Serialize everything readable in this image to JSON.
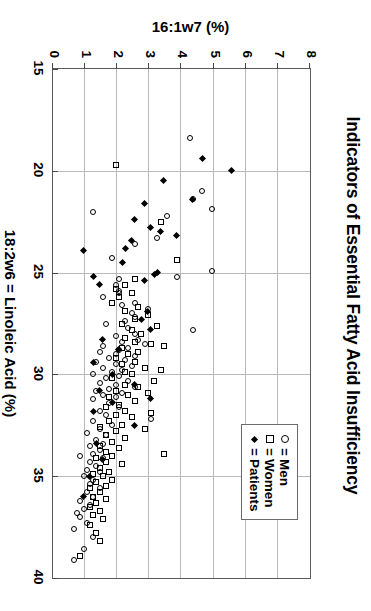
{
  "chart_data": {
    "type": "scatter",
    "title": "Indicators of Essential Fatty Acid Insufficiency",
    "xlabel": "18:2w6 = Linoleic Acid (%)",
    "ylabel": "16:1w7 (%)",
    "xlim": [
      15,
      40
    ],
    "ylim": [
      0,
      8
    ],
    "xticks": [
      15,
      20,
      25,
      30,
      35,
      40
    ],
    "yticks": [
      0,
      1,
      2,
      3,
      4,
      5,
      6,
      7,
      8
    ],
    "xtick_labels": [
      "15",
      "20",
      "25",
      "30",
      "35",
      "40"
    ],
    "ytick_labels": [
      "0",
      "1",
      "2",
      "3",
      "4",
      "5",
      "6",
      "7",
      "8"
    ],
    "grid": true,
    "rotation_deg": 90,
    "legend_position": "upper-right",
    "legend": [
      {
        "marker": "open-circle",
        "equals": "=",
        "label": "Men"
      },
      {
        "marker": "open-square",
        "equals": "=",
        "label": "Women"
      },
      {
        "marker": "filled-diamond",
        "equals": "=",
        "label": "Patients"
      }
    ],
    "series": [
      {
        "name": "Men",
        "marker": "open-circle",
        "color": "#000000",
        "points": [
          [
            18.4,
            4.25
          ],
          [
            21.0,
            4.65
          ],
          [
            21.4,
            4.35
          ],
          [
            21.9,
            4.95
          ],
          [
            22.2,
            3.55
          ],
          [
            22.0,
            1.25
          ],
          [
            23.3,
            3.25
          ],
          [
            23.6,
            2.55
          ],
          [
            24.3,
            1.85
          ],
          [
            24.9,
            4.95
          ],
          [
            25.2,
            3.85
          ],
          [
            25.3,
            2.05
          ],
          [
            25.6,
            1.95
          ],
          [
            25.9,
            2.05
          ],
          [
            26.0,
            2.05
          ],
          [
            26.2,
            1.55
          ],
          [
            26.5,
            2.55
          ],
          [
            26.8,
            2.95
          ],
          [
            26.6,
            2.15
          ],
          [
            27.0,
            2.45
          ],
          [
            27.2,
            2.55
          ],
          [
            27.4,
            2.25
          ],
          [
            27.5,
            1.65
          ],
          [
            27.7,
            2.35
          ],
          [
            27.8,
            4.35
          ],
          [
            28.0,
            2.55
          ],
          [
            28.1,
            1.95
          ],
          [
            28.3,
            2.65
          ],
          [
            28.4,
            2.15
          ],
          [
            28.5,
            2.85
          ],
          [
            28.6,
            1.55
          ],
          [
            28.7,
            2.35
          ],
          [
            28.8,
            2.05
          ],
          [
            28.9,
            1.45
          ],
          [
            29.0,
            1.95
          ],
          [
            29.1,
            2.55
          ],
          [
            29.2,
            1.75
          ],
          [
            29.3,
            2.25
          ],
          [
            29.4,
            1.35
          ],
          [
            29.5,
            1.95
          ],
          [
            29.6,
            2.45
          ],
          [
            29.7,
            1.55
          ],
          [
            29.8,
            2.15
          ],
          [
            29.9,
            1.85
          ],
          [
            30.0,
            1.25
          ],
          [
            30.1,
            2.05
          ],
          [
            30.2,
            1.65
          ],
          [
            30.3,
            2.35
          ],
          [
            30.4,
            1.45
          ],
          [
            30.5,
            1.95
          ],
          [
            30.6,
            2.55
          ],
          [
            30.7,
            1.75
          ],
          [
            30.8,
            1.35
          ],
          [
            30.9,
            2.15
          ],
          [
            31.0,
            1.55
          ],
          [
            31.1,
            1.95
          ],
          [
            31.2,
            1.25
          ],
          [
            31.4,
            1.75
          ],
          [
            31.6,
            2.05
          ],
          [
            31.8,
            1.45
          ],
          [
            32.0,
            1.65
          ],
          [
            32.2,
            3.05
          ],
          [
            32.3,
            1.25
          ],
          [
            32.5,
            1.85
          ],
          [
            32.7,
            1.45
          ],
          [
            32.9,
            1.05
          ],
          [
            33.0,
            1.65
          ],
          [
            33.2,
            1.35
          ],
          [
            33.4,
            1.55
          ],
          [
            33.5,
            1.15
          ],
          [
            33.7,
            1.45
          ],
          [
            33.9,
            1.25
          ],
          [
            34.0,
            0.85
          ],
          [
            34.1,
            1.55
          ],
          [
            34.3,
            1.15
          ],
          [
            34.5,
            1.35
          ],
          [
            34.7,
            1.05
          ],
          [
            34.8,
            1.45
          ],
          [
            35.0,
            0.95
          ],
          [
            35.2,
            1.25
          ],
          [
            35.4,
            1.15
          ],
          [
            35.6,
            1.45
          ],
          [
            35.8,
            1.05
          ],
          [
            36.0,
            1.25
          ],
          [
            36.2,
            0.85
          ],
          [
            36.4,
            1.15
          ],
          [
            36.6,
            0.95
          ],
          [
            36.8,
            0.75
          ],
          [
            37.0,
            0.85
          ],
          [
            37.3,
            1.05
          ],
          [
            37.6,
            0.65
          ],
          [
            38.0,
            1.25
          ],
          [
            38.6,
            0.95
          ],
          [
            39.1,
            0.65
          ]
        ]
      },
      {
        "name": "Women",
        "marker": "open-square",
        "color": "#000000",
        "points": [
          [
            19.7,
            1.95
          ],
          [
            22.5,
            3.35
          ],
          [
            24.4,
            3.85
          ],
          [
            25.3,
            2.55
          ],
          [
            25.6,
            2.25
          ],
          [
            25.8,
            1.95
          ],
          [
            26.0,
            2.45
          ],
          [
            26.2,
            2.05
          ],
          [
            26.5,
            1.85
          ],
          [
            26.7,
            2.65
          ],
          [
            26.9,
            2.25
          ],
          [
            27.1,
            2.95
          ],
          [
            27.3,
            2.55
          ],
          [
            27.5,
            2.15
          ],
          [
            27.6,
            3.25
          ],
          [
            27.8,
            2.45
          ],
          [
            28.0,
            2.75
          ],
          [
            28.2,
            2.25
          ],
          [
            28.4,
            2.55
          ],
          [
            28.5,
            3.05
          ],
          [
            28.7,
            2.15
          ],
          [
            28.9,
            2.65
          ],
          [
            29.0,
            2.35
          ],
          [
            29.2,
            1.95
          ],
          [
            29.4,
            2.55
          ],
          [
            29.5,
            2.15
          ],
          [
            29.7,
            2.85
          ],
          [
            29.9,
            2.25
          ],
          [
            30.0,
            2.45
          ],
          [
            30.2,
            1.85
          ],
          [
            30.3,
            3.15
          ],
          [
            30.5,
            2.25
          ],
          [
            30.6,
            2.65
          ],
          [
            30.8,
            1.95
          ],
          [
            31.0,
            2.35
          ],
          [
            31.1,
            1.75
          ],
          [
            31.3,
            2.55
          ],
          [
            31.5,
            2.05
          ],
          [
            31.6,
            1.65
          ],
          [
            31.8,
            2.25
          ],
          [
            32.0,
            1.95
          ],
          [
            32.1,
            2.45
          ],
          [
            32.3,
            1.75
          ],
          [
            32.5,
            2.15
          ],
          [
            32.6,
            1.45
          ],
          [
            32.8,
            1.95
          ],
          [
            33.0,
            1.65
          ],
          [
            33.1,
            2.25
          ],
          [
            33.3,
            1.85
          ],
          [
            33.5,
            1.45
          ],
          [
            33.6,
            2.05
          ],
          [
            33.8,
            1.65
          ],
          [
            34.0,
            1.85
          ],
          [
            34.1,
            1.35
          ],
          [
            34.3,
            1.65
          ],
          [
            34.4,
            2.15
          ],
          [
            34.6,
            1.45
          ],
          [
            34.8,
            1.75
          ],
          [
            34.9,
            1.25
          ],
          [
            35.0,
            1.55
          ],
          [
            35.2,
            1.85
          ],
          [
            35.3,
            1.35
          ],
          [
            35.5,
            1.65
          ],
          [
            35.6,
            1.15
          ],
          [
            35.8,
            1.45
          ],
          [
            36.0,
            1.25
          ],
          [
            36.1,
            1.65
          ],
          [
            36.3,
            1.35
          ],
          [
            36.5,
            1.15
          ],
          [
            36.7,
            1.45
          ],
          [
            36.9,
            1.25
          ],
          [
            37.1,
            1.55
          ],
          [
            37.4,
            1.15
          ],
          [
            37.8,
            1.35
          ],
          [
            38.2,
            1.45
          ],
          [
            38.9,
            0.85
          ],
          [
            33.9,
            3.45
          ],
          [
            32.7,
            2.85
          ],
          [
            31.9,
            3.05
          ],
          [
            30.9,
            2.95
          ],
          [
            29.8,
            3.35
          ],
          [
            28.6,
            3.45
          ]
        ]
      },
      {
        "name": "Patients",
        "marker": "filled-diamond",
        "color": "#000000",
        "points": [
          [
            19.4,
            4.65
          ],
          [
            20.0,
            5.55
          ],
          [
            20.5,
            3.45
          ],
          [
            21.4,
            4.35
          ],
          [
            21.6,
            2.85
          ],
          [
            22.4,
            2.55
          ],
          [
            23.0,
            3.35
          ],
          [
            23.2,
            3.85
          ],
          [
            23.4,
            2.45
          ],
          [
            23.8,
            2.25
          ],
          [
            23.9,
            0.95
          ],
          [
            24.5,
            2.15
          ],
          [
            25.0,
            3.25
          ],
          [
            25.1,
            3.15
          ],
          [
            25.2,
            1.25
          ],
          [
            25.6,
            1.45
          ],
          [
            26.9,
            2.95
          ],
          [
            27.3,
            2.75
          ],
          [
            28.3,
            1.55
          ],
          [
            28.8,
            2.05
          ],
          [
            29.4,
            1.25
          ],
          [
            30.0,
            1.85
          ],
          [
            30.5,
            2.55
          ],
          [
            30.8,
            1.45
          ],
          [
            31.2,
            3.05
          ],
          [
            31.4,
            1.85
          ],
          [
            31.8,
            1.25
          ],
          [
            32.5,
            2.55
          ],
          [
            33.4,
            1.35
          ],
          [
            34.2,
            1.55
          ],
          [
            35.0,
            1.15
          ],
          [
            36.0,
            0.95
          ],
          [
            27.8,
            3.05
          ],
          [
            25.4,
            2.85
          ],
          [
            22.8,
            3.05
          ]
        ]
      }
    ]
  }
}
